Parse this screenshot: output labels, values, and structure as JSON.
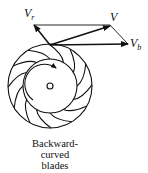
{
  "diagram": {
    "vectors": {
      "relative": {
        "symbol": "V",
        "subscript": "r"
      },
      "absolute": {
        "symbol": "V",
        "subscript": ""
      },
      "blade": {
        "symbol": "V",
        "subscript": "b"
      }
    },
    "caption_lines": [
      "Backward-",
      "curved",
      "blades"
    ],
    "blade_count": 12,
    "rotation": "clockwise"
  }
}
